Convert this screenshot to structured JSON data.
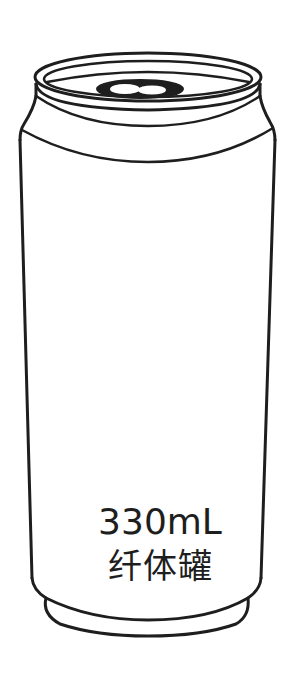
{
  "product": {
    "type": "beverage-can-illustration",
    "volume_label": "330mL",
    "name_label": "纤体罐"
  },
  "colors": {
    "background": "#ffffff",
    "outline": "#1e1e1e",
    "text": "#1e1e1e"
  },
  "icons": {
    "can": "beverage-can-icon",
    "pull_tab": "pull-tab-icon"
  }
}
